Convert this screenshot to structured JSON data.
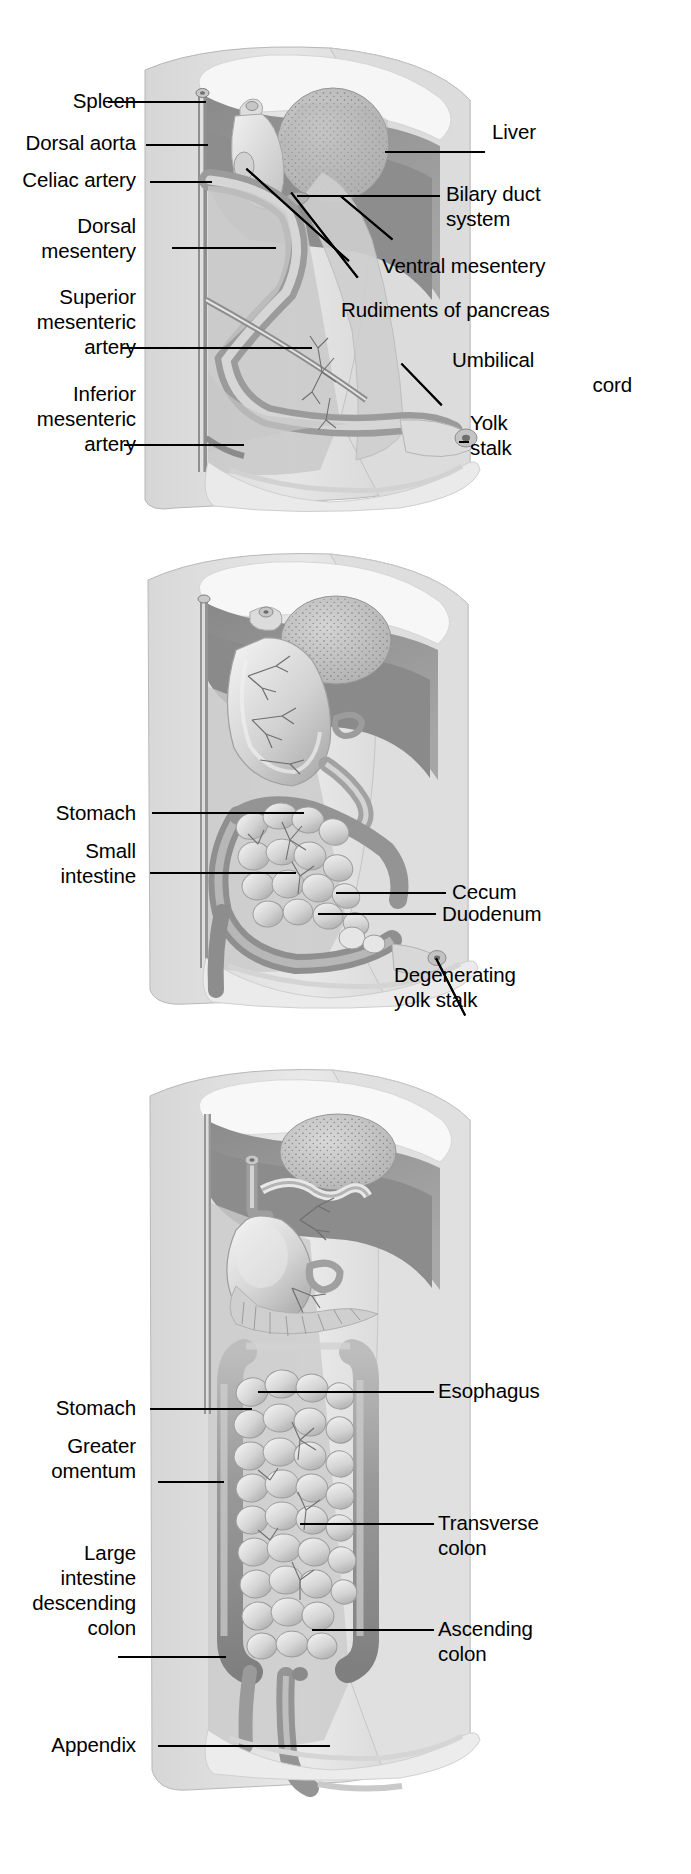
{
  "figure": {
    "panel_count": 3
  },
  "colors": {
    "ink": "#000000",
    "background": "#ffffff",
    "body_wall_light": "#e2e2e2",
    "body_wall_mid": "#cfcfcf",
    "cavity_dark": "#8e8e8e",
    "cavity_mid": "#a8a8a8",
    "organ_light": "#e8e8e8",
    "organ_mid": "#bdbdbd",
    "gut_tube": "#9a9a9a",
    "liver_fill": "#b9b9b9",
    "highlight": "#f4f4f4"
  },
  "panels": [
    {
      "id": "panel-1",
      "name": "early-gut-stage",
      "labels_left": [
        {
          "text": "Spleen",
          "lines": [
            "Spleen"
          ],
          "leader": "horizontal"
        },
        {
          "text": "Dorsal aorta",
          "lines": [
            "Dorsal aorta"
          ],
          "leader": "horizontal"
        },
        {
          "text": "Celiac artery",
          "lines": [
            "Celiac artery"
          ],
          "leader": "horizontal"
        },
        {
          "text": "Dorsal mesentery",
          "lines": [
            "Dorsal",
            "mesentery"
          ],
          "leader": "horizontal"
        },
        {
          "text": "Superior mesenteric artery",
          "lines": [
            "Superior",
            "mesenteric",
            "artery"
          ],
          "leader": "horizontal"
        },
        {
          "text": "Inferior mesenteric artery",
          "lines": [
            "Inferior",
            "mesenteric",
            "artery"
          ],
          "leader": "horizontal"
        }
      ],
      "labels_right": [
        {
          "text": "Liver",
          "lines": [
            "Liver"
          ],
          "leader": "horizontal"
        },
        {
          "text": "Bilary duct system",
          "lines": [
            "Bilary duct",
            "system"
          ],
          "leader": "horizontal"
        },
        {
          "text": "Ventral mesentery",
          "lines": [
            "Ventral mesentery"
          ],
          "leader": "diagonal"
        },
        {
          "text": "Rudiments of pancreas",
          "lines": [
            "Rudiments of pancreas"
          ],
          "leader": "diagonal-double"
        },
        {
          "text": "Umbilical cord",
          "lines": [
            "Umbilical",
            "cord"
          ],
          "leader": "diagonal"
        },
        {
          "text": "Yolk stalk",
          "lines": [
            "Yolk",
            "stalk"
          ],
          "leader": "horizontal"
        }
      ]
    },
    {
      "id": "panel-2",
      "name": "looping-gut-stage",
      "labels_left": [
        {
          "text": "Stomach",
          "lines": [
            "Stomach"
          ],
          "leader": "horizontal"
        },
        {
          "text": "Small intestine",
          "lines": [
            "Small",
            "intestine"
          ],
          "leader": "horizontal"
        }
      ],
      "labels_right": [
        {
          "text": "Duodenum",
          "lines": [
            "Duodenum"
          ],
          "leader": "horizontal"
        },
        {
          "text": "Cecum",
          "lines": [
            "Cecum"
          ],
          "leader": "horizontal"
        },
        {
          "text": "Degenerating yolk stalk",
          "lines": [
            "Degenerating",
            "yolk stalk"
          ],
          "leader": "diagonal"
        }
      ]
    },
    {
      "id": "panel-3",
      "name": "mature-gut-stage",
      "labels_left": [
        {
          "text": "Stomach",
          "lines": [
            "Stomach"
          ],
          "leader": "horizontal"
        },
        {
          "text": "Greater omentum",
          "lines": [
            "Greater",
            "omentum"
          ],
          "leader": "horizontal"
        },
        {
          "text": "Large intestine descending colon",
          "lines": [
            "Large",
            "intestine",
            "descending",
            "colon"
          ],
          "leader": "horizontal"
        },
        {
          "text": "Appendix",
          "lines": [
            "Appendix"
          ],
          "leader": "horizontal"
        }
      ],
      "labels_right": [
        {
          "text": "Esophagus",
          "lines": [
            "Esophagus"
          ],
          "leader": "horizontal"
        },
        {
          "text": "Transverse colon",
          "lines": [
            "Transverse",
            "colon"
          ],
          "leader": "horizontal"
        },
        {
          "text": "Ascending colon",
          "lines": [
            "Ascending",
            "colon"
          ],
          "leader": "horizontal"
        }
      ]
    }
  ],
  "p1": {
    "spleen": "Spleen",
    "dorsal_aorta": "Dorsal aorta",
    "celiac_artery": "Celiac artery",
    "dorsal_mesentery_1": "Dorsal",
    "dorsal_mesentery_2": "mesentery",
    "superior_1": "Superior",
    "superior_2": "mesenteric",
    "superior_3": "artery",
    "inferior_1": "Inferior",
    "inferior_2": "mesenteric",
    "inferior_3": "artery",
    "liver": "Liver",
    "bilary_1": "Bilary duct",
    "bilary_2": "system",
    "ventral_mesentery": "Ventral mesentery",
    "rudiments": "Rudiments of pancreas",
    "umbilical_1": "Umbilical",
    "umbilical_2": "cord",
    "yolk_1": "Yolk",
    "yolk_2": "stalk"
  },
  "p2": {
    "stomach": "Stomach",
    "small_1": "Small",
    "small_2": "intestine",
    "duodenum": "Duodenum",
    "cecum": "Cecum",
    "degen_1": "Degenerating",
    "degen_2": "yolk stalk"
  },
  "p3": {
    "stomach": "Stomach",
    "greater_1": "Greater",
    "greater_2": "omentum",
    "large_1": "Large",
    "large_2": "intestine",
    "large_3": "descending",
    "large_4": "colon",
    "appendix": "Appendix",
    "esophagus": "Esophagus",
    "transverse_1": "Transverse",
    "transverse_2": "colon",
    "ascending_1": "Ascending",
    "ascending_2": "colon"
  }
}
